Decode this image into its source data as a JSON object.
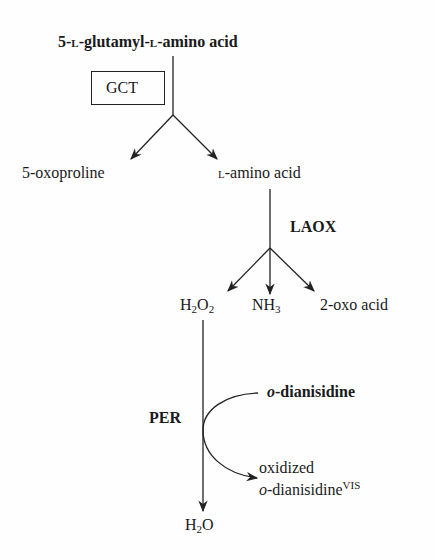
{
  "substrate": {
    "prefix": "5-",
    "l1": "L",
    "mid": "-glutamyl-",
    "l2": "L",
    "suffix": "-amino acid"
  },
  "enzymes": {
    "gct": "GCT",
    "laox": "LAOX",
    "per": "PER"
  },
  "products_gct": {
    "oxoproline": "5-oxoproline",
    "amino_l": "L",
    "amino_rest": "-amino acid"
  },
  "products_laox": {
    "h2o2_h": "H",
    "h2o2_2a": "2",
    "h2o2_o": "O",
    "h2o2_2b": "2",
    "nh3_nh": "NH",
    "nh3_3": "3",
    "oxo_acid": "2-oxo acid"
  },
  "per_reaction": {
    "cosubstrate_o": "o",
    "cosubstrate_rest": "-dianisidine",
    "product_line1": "oxidized",
    "product_o": "o",
    "product_rest": "-dianisidine",
    "product_sup": "VIS",
    "water_h": "H",
    "water_2": "2",
    "water_o": "O"
  }
}
